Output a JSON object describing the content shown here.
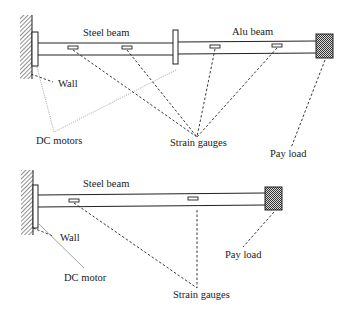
{
  "colors": {
    "stroke": "#222222",
    "pointer_dashed": "#222222",
    "pointer_motor": "#9a9a9a",
    "hatch": "#444444",
    "payload": "#333333",
    "background": "#ffffff"
  },
  "top_diagram": {
    "labels": {
      "steel_beam": "Steel beam",
      "alu_beam": "Alu beam",
      "wall": "Wall",
      "dc_motors": "DC motors",
      "strain_gauges": "Strain gauges",
      "pay_load": "Pay load"
    },
    "components": [
      "wall",
      "dc-motor-base",
      "steel-beam",
      "dc-motor-joint",
      "alu-beam",
      "payload"
    ],
    "strain_gauge_count": 4
  },
  "bottom_diagram": {
    "labels": {
      "steel_beam": "Steel beam",
      "wall": "Wall",
      "dc_motor": "DC motor",
      "strain_gauges": "Strain gauges",
      "pay_load": "Pay load"
    },
    "components": [
      "wall",
      "dc-motor-base",
      "steel-beam",
      "payload"
    ],
    "strain_gauge_count": 2
  }
}
